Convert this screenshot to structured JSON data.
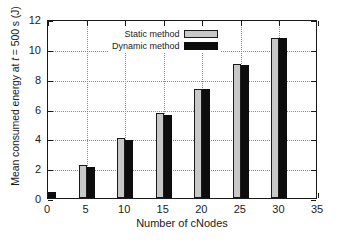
{
  "chart_data": {
    "type": "bar",
    "title": "",
    "xlabel": "Number of cNodes",
    "ylabel": "Mean consumed energy at t = 500 s (J)",
    "ylabel_prefix": "Mean consumed energy at ",
    "ylabel_italic": "t",
    "ylabel_suffix": " = 500 s (J)",
    "categories": [
      0,
      5,
      10,
      15,
      20,
      25,
      30
    ],
    "xticks": [
      0,
      5,
      10,
      15,
      20,
      25,
      30,
      35
    ],
    "yticks": [
      0,
      2,
      4,
      6,
      8,
      10,
      12
    ],
    "xlim": [
      0,
      35
    ],
    "ylim": [
      0,
      12
    ],
    "grid": true,
    "legend_position": "top-left",
    "series": [
      {
        "name": "Static method",
        "color": "#c8c8c8",
        "values": [
          0,
          2.2,
          4.0,
          5.7,
          7.3,
          9.0,
          10.7
        ]
      },
      {
        "name": "Dynamic method",
        "color": "#0d0d0d",
        "values": [
          0.4,
          2.1,
          3.9,
          5.55,
          7.3,
          8.95,
          10.75
        ]
      }
    ]
  },
  "legend": {
    "items": [
      {
        "label": "Static method",
        "style": "static"
      },
      {
        "label": "Dynamic method",
        "style": "dynamic"
      }
    ]
  }
}
